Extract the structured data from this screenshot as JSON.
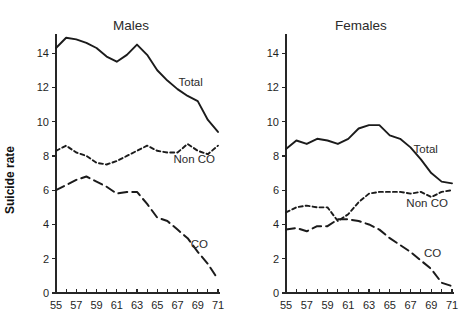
{
  "figure": {
    "background": "#ffffff",
    "line_color": "#1b1b1b",
    "y_axis_label": "Suicide rate"
  },
  "chart_data": [
    {
      "type": "line",
      "title": "Males",
      "xlabel": "",
      "ylabel": "Suicide rate",
      "xlim": [
        55,
        71
      ],
      "ylim": [
        0,
        15
      ],
      "xticks": [
        55,
        56,
        57,
        58,
        59,
        60,
        61,
        62,
        63,
        64,
        65,
        66,
        67,
        68,
        69,
        70,
        71
      ],
      "xtick_labels": [
        "55",
        "",
        "57",
        "",
        "59",
        "",
        "61",
        "",
        "63",
        "",
        "65",
        "",
        "67",
        "",
        "69",
        "",
        "71"
      ],
      "yticks": [
        0,
        2,
        4,
        6,
        8,
        10,
        12,
        14
      ],
      "ytick_labels": [
        "0",
        "2",
        "4",
        "6",
        "8",
        "10",
        "12",
        "14"
      ],
      "grid": false,
      "legend": "inline-annotations",
      "x": [
        55,
        56,
        57,
        58,
        59,
        60,
        61,
        62,
        63,
        64,
        65,
        66,
        67,
        68,
        69,
        70,
        71
      ],
      "series": [
        {
          "name": "Total",
          "style": "solid",
          "label_x": 67.1,
          "label_y": 12.1,
          "values": [
            14.3,
            14.9,
            14.8,
            14.6,
            14.3,
            13.8,
            13.5,
            13.9,
            14.5,
            13.9,
            13.0,
            12.4,
            11.9,
            11.5,
            11.2,
            10.1,
            9.4
          ]
        },
        {
          "name": "Non CO",
          "style": "dashed-short",
          "label_x": 66.6,
          "label_y": 7.6,
          "values": [
            8.3,
            8.6,
            8.2,
            8.0,
            7.6,
            7.5,
            7.7,
            8.0,
            8.3,
            8.6,
            8.3,
            8.2,
            8.2,
            8.7,
            8.3,
            8.1,
            8.6
          ]
        },
        {
          "name": "CO",
          "style": "dashed-long",
          "label_x": 68.3,
          "label_y": 2.6,
          "values": [
            6.0,
            6.3,
            6.6,
            6.8,
            6.5,
            6.2,
            5.8,
            5.9,
            5.9,
            5.2,
            4.4,
            4.2,
            3.7,
            3.2,
            2.4,
            1.7,
            0.8
          ]
        }
      ]
    },
    {
      "type": "line",
      "title": "Females",
      "xlabel": "",
      "ylabel": "",
      "xlim": [
        55,
        71
      ],
      "ylim": [
        0,
        15
      ],
      "xticks": [
        55,
        56,
        57,
        58,
        59,
        60,
        61,
        62,
        63,
        64,
        65,
        66,
        67,
        68,
        69,
        70,
        71
      ],
      "xtick_labels": [
        "55",
        "",
        "57",
        "",
        "59",
        "",
        "61",
        "",
        "63",
        "",
        "65",
        "",
        "67",
        "",
        "69",
        "",
        "71"
      ],
      "yticks": [
        0,
        2,
        4,
        6,
        8,
        10,
        12,
        14
      ],
      "ytick_labels": [
        "0",
        "2",
        "4",
        "6",
        "8",
        "10",
        "12",
        "14"
      ],
      "grid": false,
      "legend": "inline-annotations",
      "x": [
        55,
        56,
        57,
        58,
        59,
        60,
        61,
        62,
        63,
        64,
        65,
        66,
        67,
        68,
        69,
        70,
        71
      ],
      "series": [
        {
          "name": "Total",
          "style": "solid",
          "label_x": 67.3,
          "label_y": 8.2,
          "values": [
            8.4,
            8.9,
            8.7,
            9.0,
            8.9,
            8.7,
            9.0,
            9.6,
            9.8,
            9.8,
            9.2,
            9.0,
            8.5,
            7.8,
            7.0,
            6.5,
            6.4
          ]
        },
        {
          "name": "Non CO",
          "style": "dashed-short",
          "label_x": 66.6,
          "label_y": 5.0,
          "values": [
            4.7,
            5.0,
            5.1,
            5.0,
            5.0,
            4.2,
            4.6,
            5.3,
            5.8,
            5.9,
            5.9,
            5.9,
            5.8,
            5.9,
            5.6,
            5.9,
            6.0
          ]
        },
        {
          "name": "CO",
          "style": "dashed-long",
          "label_x": 68.3,
          "label_y": 2.1,
          "values": [
            3.7,
            3.8,
            3.6,
            3.9,
            3.9,
            4.3,
            4.3,
            4.2,
            4.0,
            3.7,
            3.2,
            2.8,
            2.4,
            1.9,
            1.4,
            0.6,
            0.4
          ]
        }
      ]
    }
  ]
}
